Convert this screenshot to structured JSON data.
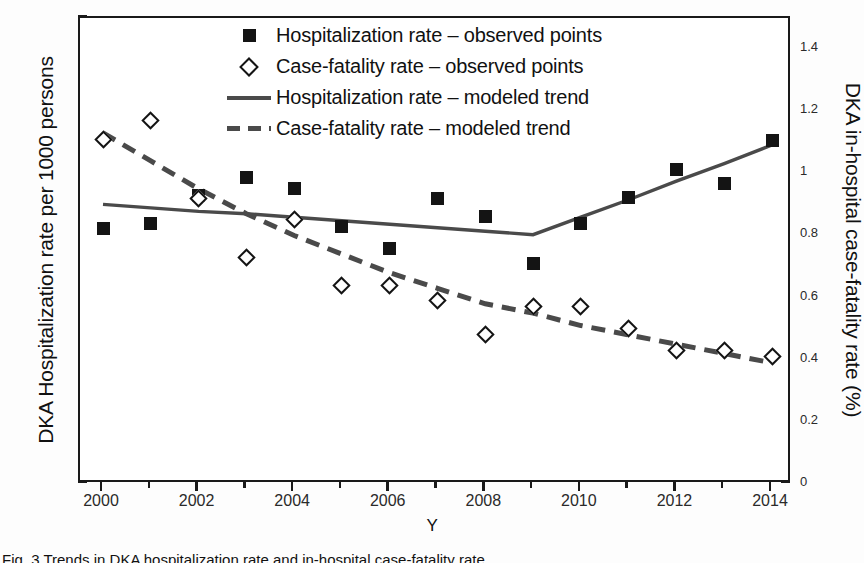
{
  "axes": {
    "y_left_title": "DKA Hospitalization rate per 1000 persons",
    "y_right_title": "DKA in-hospital case-fatality rate (%)",
    "x_title": "Y",
    "y_left_ticks": [
      "0",
      "5",
      "10",
      "15",
      "20",
      "25",
      "30",
      "35",
      "40"
    ],
    "y_right_ticks": [
      "0",
      "0.2",
      "0.4",
      "0.6",
      "0.8",
      "1",
      "1.2",
      "1.4"
    ],
    "x_ticks": [
      "2000",
      "2002",
      "2004",
      "2006",
      "2008",
      "2010",
      "2012",
      "2014"
    ]
  },
  "legend": {
    "items": [
      {
        "key": "filled-square-marker",
        "label": "Hospitalization rate – observed points"
      },
      {
        "key": "open-diamond-marker",
        "label": "Case-fatality rate – observed points"
      },
      {
        "key": "solid-line",
        "label": "Hospitalization rate – modeled trend"
      },
      {
        "key": "dashed-line",
        "label": "Case-fatality rate – modeled trend"
      }
    ]
  },
  "caption": "Fig. 3  Trends in DKA hospitalization rate and in-hospital case-fatality rate",
  "colors": {
    "marker": "#141414",
    "trend_line": "#4a4a4a",
    "axis": "#1a1a1a",
    "background": "#ffffff"
  },
  "chart_data": {
    "type": "line",
    "title": "",
    "xlabel": "Y",
    "ylabel": "DKA Hospitalization rate per 1000 persons",
    "y2label": "DKA in-hospital case-fatality rate (%)",
    "xlim": [
      1999.5,
      2014.8
    ],
    "ylim": [
      0,
      40
    ],
    "y2lim": [
      0,
      1.5
    ],
    "grid": false,
    "legend_position": "top-center",
    "x": [
      2000,
      2001,
      2002,
      2003,
      2004,
      2005,
      2006,
      2007,
      2008,
      2009,
      2010,
      2011,
      2012,
      2013,
      2014
    ],
    "series": [
      {
        "name": "Hospitalization rate – observed points",
        "axis": "left",
        "marker": "filled-square",
        "units": "per 1000 persons",
        "values": [
          21.9,
          22.4,
          24.8,
          26.3,
          25.4,
          22.1,
          20.2,
          24.5,
          23.0,
          18.9,
          22.4,
          24.6,
          27.0,
          25.8,
          29.5
        ]
      },
      {
        "name": "Case-fatality rate – observed points",
        "axis": "right",
        "marker": "open-diamond",
        "units": "%",
        "values": [
          1.11,
          1.17,
          0.92,
          0.73,
          0.85,
          0.64,
          0.64,
          0.59,
          0.48,
          0.57,
          0.57,
          0.5,
          0.43,
          0.43,
          0.41
        ]
      },
      {
        "name": "Hospitalization rate – modeled trend",
        "axis": "left",
        "line": "solid",
        "joinpoint": 2009,
        "values": [
          24.0,
          23.7,
          23.4,
          23.2,
          22.9,
          22.6,
          22.3,
          22.0,
          21.7,
          21.4,
          22.9,
          24.4,
          26.0,
          27.5,
          29.1
        ]
      },
      {
        "name": "Case-fatality rate – modeled trend",
        "axis": "right",
        "line": "dashed",
        "values": [
          1.13,
          1.04,
          0.95,
          0.87,
          0.8,
          0.74,
          0.68,
          0.63,
          0.58,
          0.55,
          0.51,
          0.48,
          0.45,
          0.42,
          0.39
        ]
      }
    ]
  }
}
